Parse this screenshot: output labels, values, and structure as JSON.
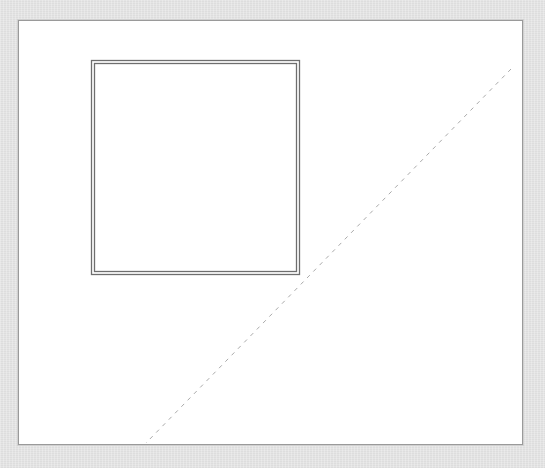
{
  "canvas": {
    "background": "#ffffff",
    "border_color": "#9a9a9a"
  },
  "shapes": {
    "square": {
      "type": "double-border-rectangle",
      "outer": {
        "x": 91,
        "y": 60,
        "w": 208,
        "h": 214
      },
      "inner_inset": 3,
      "stroke": "#6e6e6e"
    },
    "diagonal": {
      "type": "dashed-line",
      "x1": 511,
      "y1": 69,
      "x2": 146,
      "y2": 443,
      "stroke": "#aaaaaa",
      "dash": "4 5"
    }
  }
}
